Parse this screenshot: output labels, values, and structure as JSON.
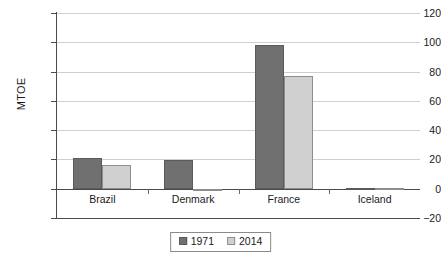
{
  "chart_data": {
    "type": "bar",
    "title": "",
    "xlabel": "",
    "ylabel": "MTOE",
    "ylim": [
      -20,
      120
    ],
    "ytick_values": [
      120,
      100,
      80,
      60,
      40,
      20,
      0,
      -20
    ],
    "ytick_labels": [
      "120",
      "100",
      "80",
      "60",
      "40",
      "20",
      "0",
      "−20"
    ],
    "grid": true,
    "legend_position": "bottom-center",
    "categories": [
      "Brazil",
      "Denmark",
      "France",
      "Iceland"
    ],
    "series": [
      {
        "name": "1971",
        "color": "#707070",
        "values": [
          21,
          19.5,
          98,
          0.5
        ]
      },
      {
        "name": "2014",
        "color": "#d0d0d0",
        "values": [
          16,
          -1.5,
          77,
          0.3
        ]
      }
    ]
  },
  "legend": {
    "entries": [
      {
        "label": "1971"
      },
      {
        "label": "2014"
      }
    ]
  },
  "colors": {
    "series_1971": "#707070",
    "series_2014": "#d0d0d0",
    "axis": "#4a4a4a",
    "gridline": "#cfcfcf",
    "background": "#ffffff"
  }
}
